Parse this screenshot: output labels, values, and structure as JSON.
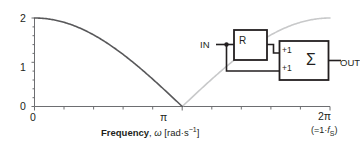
{
  "chart_data": {
    "type": "line",
    "title": "",
    "xlabel": "Frequency, ω [rad·s⁻¹]",
    "ylabel": "",
    "xlim": [
      0,
      6.283185
    ],
    "ylim": [
      0,
      2.1
    ],
    "grid": false,
    "legend": "none",
    "x_tick_labels": [
      "0",
      "π",
      "2π"
    ],
    "x_tick_values": [
      0,
      3.141593,
      6.283185
    ],
    "x_minor_tick_count_per_major": 5,
    "y_tick_labels": [
      "0",
      "1",
      "2"
    ],
    "y_tick_values": [
      0,
      1,
      2
    ],
    "y_minor_tick_count_per_major": 5,
    "series": [
      {
        "name": "magnitude-response-principal",
        "color": "#58585a",
        "width": 1.6,
        "comment": "|H| = 2*|cos(w/2)| over 0..pi",
        "x": [
          0.0,
          0.3142,
          0.6283,
          0.9425,
          1.2566,
          1.5708,
          1.885,
          2.1991,
          2.5133,
          2.8274,
          3.1416
        ],
        "y": [
          2.0,
          1.9754,
          1.9021,
          1.782,
          1.618,
          1.4142,
          1.1756,
          0.908,
          0.618,
          0.3129,
          0.0
        ]
      },
      {
        "name": "magnitude-response-alias",
        "color": "#c8c9ca",
        "width": 1.6,
        "comment": "mirror image above Nyquist, pi..2pi",
        "x": [
          3.1416,
          3.4558,
          3.7699,
          4.0841,
          4.3982,
          4.7124,
          5.0265,
          5.3407,
          5.6549,
          5.969,
          6.2832
        ],
        "y": [
          0.0,
          0.3129,
          0.618,
          0.908,
          1.1756,
          1.4142,
          1.618,
          1.782,
          1.9021,
          1.9754,
          2.0
        ]
      }
    ]
  },
  "axis": {
    "y_labels": [
      "2",
      "1",
      "0"
    ],
    "x_label_left": "0",
    "x_label_mid": "π",
    "x_label_right": "2π",
    "x_label_right_note_open": "(=1·",
    "x_label_right_note_f": "f",
    "x_label_right_note_sub": "S",
    "x_label_right_note_close": ")",
    "title_bold": "Frequency",
    "title_comma": ",",
    "title_symbol": "ω",
    "title_units_open": " [rad·s",
    "title_units_exp": "−1",
    "title_units_close": "]",
    "color": "#6d6e71"
  },
  "block_diagram": {
    "input_label": "IN",
    "output_label": "OUT",
    "delay_label": "R",
    "summer_label": "Σ",
    "gain_top_label": "+1",
    "gain_bottom_label": "+1",
    "line_color": "#231f20"
  }
}
